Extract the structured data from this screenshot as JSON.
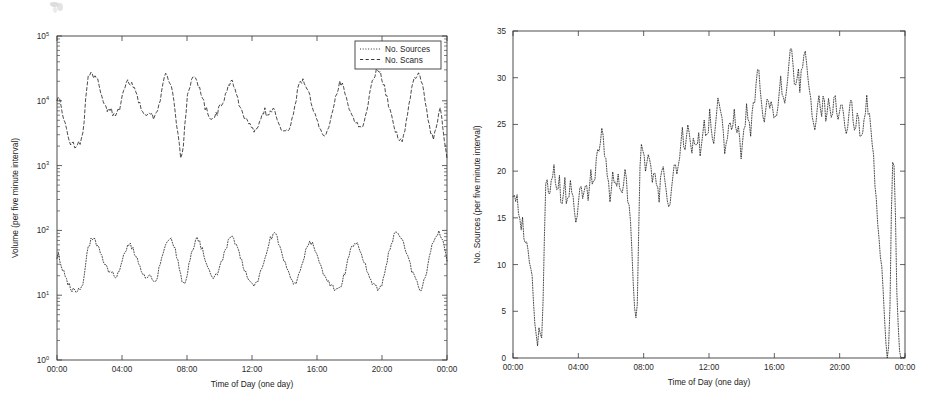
{
  "figure": {
    "background_color": "#ffffff",
    "ink_color": "#111111",
    "panel_count": 2
  },
  "chart_data": [
    {
      "id": "left-panel",
      "type": "line",
      "title": "",
      "xlabel": "Time of Day (one day)",
      "ylabel": "Volume (per five minute interval)",
      "yscale": "log",
      "ylim": [
        1,
        100000
      ],
      "ytick_labels": [
        "10^0",
        "10^1",
        "10^2",
        "10^3",
        "10^4",
        "10^5"
      ],
      "ytick_mantissas": [
        "10",
        "10",
        "10",
        "10",
        "10",
        "10"
      ],
      "ytick_exponents": [
        "0",
        "1",
        "2",
        "3",
        "4",
        "5"
      ],
      "ytick_values": [
        1,
        10,
        100,
        1000,
        10000,
        100000
      ],
      "xlim_hours": [
        0,
        24
      ],
      "xtick_hours": [
        0,
        4,
        8,
        12,
        16,
        20,
        24
      ],
      "xtick_labels": [
        "00:00",
        "04:00",
        "08:00",
        "12:00",
        "16:00",
        "20:00",
        "00:00"
      ],
      "grid": false,
      "legend_position": "top-right",
      "legend": [
        {
          "label": "No. Sources",
          "linestyle": "dotted"
        },
        {
          "label": "No. Scans",
          "linestyle": "dashed"
        }
      ],
      "series": [
        {
          "name": "No. Scans",
          "linestyle": "dashed",
          "units": "scans per five minute interval",
          "peak_count_per_day": 8,
          "approx_min": 1200,
          "approx_max": 30000,
          "values": [
            11000,
            12500,
            10000,
            8200,
            6500,
            5200,
            4200,
            3600,
            3100,
            2600,
            2300,
            2100,
            2200,
            2000,
            1900,
            2300,
            2600,
            2200,
            2500,
            3000,
            4500,
            9000,
            17000,
            23000,
            26000,
            27500,
            25000,
            23000,
            24000,
            22000,
            20000,
            17000,
            15000,
            13000,
            11000,
            9500,
            8200,
            7600,
            7000,
            6800,
            7200,
            6400,
            6000,
            5800,
            6200,
            6600,
            7200,
            8500,
            10500,
            13000,
            16000,
            19000,
            21000,
            20000,
            18500,
            19500,
            18000,
            16000,
            14000,
            12000,
            10500,
            9000,
            7800,
            7000,
            6400,
            6000,
            5800,
            6100,
            6500,
            6300,
            6000,
            5600,
            5400,
            5800,
            6500,
            8000,
            10000,
            13500,
            17000,
            21000,
            24000,
            25500,
            23000,
            20000,
            17000,
            14000,
            11000,
            8000,
            5200,
            3400,
            2200,
            1500,
            1300,
            1800,
            3000,
            6000,
            10000,
            14000,
            17000,
            19000,
            21000,
            23000,
            22000,
            20000,
            18000,
            16000,
            13500,
            11500,
            9800,
            8500,
            7500,
            6800,
            6200,
            5900,
            5700,
            5500,
            5600,
            5900,
            6300,
            7000,
            7800,
            8800,
            9600,
            10500,
            11500,
            13000,
            15000,
            17000,
            18500,
            19500,
            18000,
            16000,
            14000,
            12000,
            10000,
            8500,
            7400,
            6600,
            6000,
            5500,
            5200,
            4800,
            4400,
            4000,
            3700,
            3500,
            3400,
            3600,
            3900,
            4300,
            4800,
            5600,
            6500,
            7200,
            6800,
            6200,
            5900,
            6400,
            7000,
            7600,
            7200,
            6600,
            6000,
            5400,
            4800,
            4200,
            3800,
            3400,
            3200,
            3100,
            3300,
            3600,
            4200,
            5000,
            6000,
            7500,
            9500,
            12000,
            15000,
            17500,
            19500,
            20500,
            19500,
            18000,
            16500,
            15000,
            13000,
            11000,
            9200,
            7800,
            6600,
            5600,
            4800,
            4200,
            3700,
            3400,
            3200,
            3000,
            2900,
            3100,
            3500,
            4200,
            5200,
            6500,
            8000,
            10000,
            12500,
            15000,
            17500,
            19000,
            18000,
            16500,
            15000,
            13000,
            11000,
            9200,
            7800,
            6600,
            5800,
            5200,
            4800,
            4400,
            4100,
            3900,
            3800,
            4000,
            4400,
            5200,
            6400,
            8000,
            10000,
            13000,
            16500,
            20000,
            24000,
            27000,
            29500,
            30000,
            28000,
            25000,
            22000,
            19000,
            16000,
            13000,
            10500,
            8500,
            7000,
            5800,
            4800,
            4000,
            3500,
            3000,
            2700,
            2500,
            2400,
            2600,
            3000,
            3800,
            5000,
            7000,
            9500,
            12500,
            16000,
            19500,
            22500,
            24500,
            25500,
            24000,
            22000,
            19000,
            16000,
            13000,
            10000,
            7500,
            5500,
            4200,
            3400,
            3000,
            2800,
            3000,
            3500,
            4500,
            6000,
            8000,
            6000,
            4000,
            2600,
            1800,
            1400
          ]
        },
        {
          "name": "No. Sources",
          "linestyle": "dotted",
          "units": "sources per five minute interval",
          "peak_count_per_day": 8,
          "approx_min": 8,
          "approx_max": 95,
          "values": [
            38,
            42,
            36,
            30,
            26,
            22,
            19,
            17,
            15,
            14,
            13,
            12,
            13,
            12,
            11,
            12,
            13,
            12,
            13,
            15,
            19,
            28,
            40,
            52,
            62,
            70,
            75,
            72,
            68,
            64,
            58,
            52,
            46,
            40,
            35,
            31,
            28,
            26,
            24,
            23,
            22,
            21,
            20,
            19,
            20,
            21,
            23,
            26,
            31,
            37,
            44,
            52,
            58,
            62,
            60,
            56,
            52,
            47,
            42,
            37,
            33,
            29,
            26,
            23,
            21,
            19,
            18,
            18,
            19,
            19,
            18,
            17,
            16,
            17,
            19,
            23,
            28,
            35,
            43,
            52,
            60,
            68,
            74,
            78,
            74,
            68,
            60,
            52,
            44,
            36,
            29,
            23,
            18,
            16,
            15,
            17,
            21,
            27,
            34,
            42,
            50,
            58,
            66,
            72,
            70,
            65,
            59,
            52,
            45,
            39,
            34,
            30,
            27,
            24,
            22,
            20,
            19,
            19,
            20,
            22,
            25,
            29,
            34,
            40,
            47,
            55,
            64,
            72,
            78,
            80,
            76,
            70,
            63,
            56,
            48,
            42,
            36,
            31,
            27,
            24,
            21,
            19,
            17,
            16,
            15,
            14,
            14,
            15,
            16,
            18,
            21,
            25,
            30,
            36,
            43,
            51,
            60,
            68,
            76,
            84,
            88,
            85,
            78,
            70,
            62,
            54,
            46,
            39,
            33,
            28,
            24,
            21,
            19,
            17,
            16,
            15,
            15,
            16,
            18,
            21,
            25,
            30,
            36,
            43,
            50,
            57,
            63,
            67,
            65,
            60,
            54,
            48,
            42,
            36,
            31,
            27,
            24,
            21,
            19,
            17,
            16,
            15,
            14,
            13,
            13,
            12,
            12,
            13,
            13,
            14,
            15,
            17,
            20,
            24,
            29,
            35,
            42,
            50,
            57,
            63,
            67,
            65,
            60,
            54,
            48,
            42,
            36,
            31,
            27,
            23,
            20,
            18,
            16,
            15,
            14,
            13,
            13,
            12,
            12,
            13,
            15,
            18,
            22,
            28,
            36,
            45,
            55,
            65,
            74,
            82,
            88,
            92,
            90,
            85,
            78,
            70,
            62,
            54,
            46,
            39,
            33,
            28,
            24,
            21,
            18,
            16,
            15,
            14,
            13,
            13,
            14,
            16,
            19,
            24,
            30,
            38,
            47,
            57,
            67,
            76,
            84,
            90,
            92,
            88,
            80,
            68,
            55,
            44,
            36
          ]
        }
      ]
    },
    {
      "id": "right-panel",
      "type": "line",
      "title": "",
      "xlabel": "Time of Day (one day)",
      "ylabel": "No. Sources (per five minute interval)",
      "yscale": "linear",
      "ylim": [
        0,
        35
      ],
      "ytick_values": [
        0,
        5,
        10,
        15,
        20,
        25,
        30,
        35
      ],
      "ytick_labels": [
        "0",
        "5",
        "10",
        "15",
        "20",
        "25",
        "30",
        "35"
      ],
      "xlim_hours": [
        0,
        24
      ],
      "xtick_hours": [
        0,
        4,
        8,
        12,
        16,
        20,
        24
      ],
      "xtick_labels": [
        "00:00",
        "04:00",
        "08:00",
        "12:00",
        "16:00",
        "20:00",
        "00:00"
      ],
      "grid": false,
      "legend_position": "none",
      "legend": [],
      "series": [
        {
          "name": "No. Sources",
          "linestyle": "dotted",
          "units": "sources per five minute interval",
          "approx_min": 1,
          "approx_max": 33,
          "notable_dropouts": [
            {
              "hour": 0.7,
              "value": 1
            },
            {
              "hour": 6.5,
              "value": 4
            },
            {
              "hour": 23.3,
              "value": 0
            }
          ],
          "values": [
            17,
            18,
            17,
            18,
            17,
            16,
            15,
            14,
            15,
            14,
            13,
            12,
            13,
            12,
            11,
            10,
            10,
            9,
            7,
            5,
            3,
            2,
            2,
            3,
            2,
            1,
            3,
            8,
            14,
            18,
            20,
            19,
            17,
            18,
            19,
            20,
            21,
            19,
            18,
            17,
            18,
            19,
            17,
            16,
            17,
            18,
            19,
            17,
            16,
            17,
            18,
            19,
            18,
            17,
            16,
            15,
            14,
            15,
            16,
            18,
            19,
            18,
            17,
            18,
            19,
            18,
            17,
            18,
            19,
            20,
            19,
            18,
            19,
            20,
            21,
            22,
            23,
            22,
            24,
            25,
            23,
            22,
            21,
            20,
            19,
            18,
            17,
            18,
            19,
            20,
            19,
            18,
            19,
            20,
            19,
            18,
            17,
            18,
            19,
            20,
            19,
            18,
            17,
            16,
            15,
            13,
            10,
            7,
            5,
            4,
            6,
            12,
            18,
            22,
            23,
            23,
            22,
            21,
            20,
            21,
            22,
            21,
            20,
            19,
            20,
            21,
            20,
            19,
            18,
            17,
            18,
            19,
            20,
            21,
            20,
            19,
            18,
            17,
            16,
            17,
            18,
            19,
            20,
            21,
            20,
            19,
            20,
            21,
            22,
            23,
            24,
            23,
            22,
            23,
            24,
            25,
            24,
            23,
            22,
            23,
            24,
            23,
            22,
            23,
            24,
            23,
            22,
            23,
            24,
            25,
            24,
            23,
            24,
            25,
            26,
            25,
            24,
            23,
            24,
            25,
            26,
            27,
            28,
            27,
            26,
            25,
            24,
            23,
            22,
            23,
            24,
            25,
            26,
            25,
            24,
            25,
            26,
            25,
            24,
            25,
            24,
            23,
            22,
            23,
            24,
            25,
            26,
            27,
            26,
            25,
            24,
            25,
            26,
            27,
            28,
            29,
            30,
            31,
            30,
            28,
            27,
            26,
            25,
            26,
            27,
            28,
            27,
            26,
            27,
            28,
            27,
            26,
            25,
            26,
            27,
            28,
            29,
            30,
            29,
            28,
            27,
            28,
            29,
            30,
            31,
            32,
            33,
            32,
            31,
            30,
            29,
            30,
            31,
            30,
            29,
            30,
            31,
            32,
            33,
            32,
            31,
            30,
            29,
            28,
            27,
            26,
            25,
            24,
            25,
            26,
            27,
            28,
            27,
            26,
            27,
            28,
            27,
            26,
            27,
            28,
            27,
            26,
            25,
            26,
            27,
            28,
            27,
            26,
            25,
            26,
            27,
            28,
            27,
            26,
            25,
            24,
            25,
            26,
            27,
            28,
            27,
            26,
            25,
            24,
            25,
            26,
            25,
            24,
            23,
            24,
            25,
            26,
            27,
            28,
            27,
            26,
            25,
            24,
            23,
            22,
            20,
            18,
            16,
            14,
            13,
            12,
            10,
            8,
            6,
            4,
            2,
            1,
            0,
            2,
            8,
            16,
            21,
            22,
            18,
            12,
            6,
            3,
            1,
            0,
            0,
            0,
            0,
            0
          ]
        }
      ]
    }
  ]
}
